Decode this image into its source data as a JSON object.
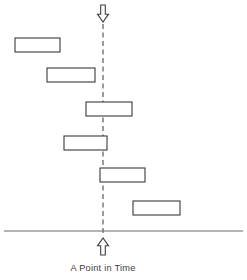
{
  "diagram": {
    "caption": "A Point in Time",
    "canvas": {
      "width": 247,
      "height": 280,
      "background": "#ffffff"
    },
    "colors": {
      "bar_stroke": "#3a3a3a",
      "bar_fill": "#ffffff",
      "dashed_line": "#4a4a4a",
      "baseline": "#6a6a6a",
      "arrow_stroke": "#3f3f3f",
      "arrow_fill": "#ffffff",
      "text": "#3c3c3c"
    },
    "timeline": {
      "label": "vertical-point-in-time-line",
      "x": 103,
      "y_top": 24,
      "y_bottom": 233,
      "style": "dashed",
      "dash_pattern": "5 3.5"
    },
    "baseline": {
      "label": "horizontal-baseline",
      "x_start": 4,
      "x_end": 243,
      "y": 231
    },
    "arrows": [
      {
        "name": "top-down-arrow",
        "direction": "down",
        "x": 103,
        "y_top": 5,
        "y_bottom": 22,
        "width": 11
      },
      {
        "name": "bottom-up-arrow",
        "direction": "up",
        "x": 103,
        "y_top": 238,
        "y_bottom": 255,
        "width": 11
      }
    ],
    "bars": [
      {
        "name": "bar-1",
        "x": 15,
        "y": 38,
        "width": 45,
        "height": 14,
        "crosses_line": false,
        "side": "left"
      },
      {
        "name": "bar-2",
        "x": 47,
        "y": 68,
        "width": 48,
        "height": 14,
        "crosses_line": false,
        "side": "left"
      },
      {
        "name": "bar-3",
        "x": 86,
        "y": 102,
        "width": 46,
        "height": 14,
        "crosses_line": true,
        "side": "straddle"
      },
      {
        "name": "bar-4",
        "x": 64,
        "y": 136,
        "width": 43,
        "height": 14,
        "crosses_line": true,
        "side": "straddle"
      },
      {
        "name": "bar-5",
        "x": 100,
        "y": 168,
        "width": 45,
        "height": 14,
        "crosses_line": true,
        "side": "straddle"
      },
      {
        "name": "bar-6",
        "x": 133,
        "y": 201,
        "width": 47,
        "height": 14,
        "crosses_line": false,
        "side": "right"
      }
    ],
    "caption_position": {
      "x": 103,
      "y": 271
    }
  }
}
